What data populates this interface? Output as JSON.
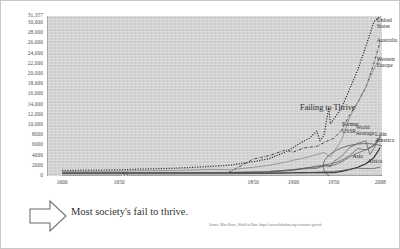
{
  "slide": {
    "caption": "Most society's fail to thrive.",
    "source": "Source: Max Roser, World in Data. https://ourworldindata.org/economic-growth",
    "arrow_icon": "right-arrow-icon"
  },
  "chart_data": {
    "type": "line",
    "title": "",
    "xlabel": "",
    "ylabel": "",
    "xlim": [
      1600,
      2008
    ],
    "ylim": [
      0,
      31357
    ],
    "grid": false,
    "legend": "inline-series-labels",
    "axis_break": {
      "after": 1650,
      "resumes": 1700
    },
    "ytick_labels": [
      "31,357",
      "30,000",
      "28,000",
      "26,000",
      "24,000",
      "22,000",
      "20,000",
      "18,000",
      "16,000",
      "14,000",
      "12,000",
      "10,000",
      "8000",
      "6000",
      "4000",
      "2000",
      "0"
    ],
    "ytick_values": [
      31357,
      30000,
      28000,
      26000,
      24000,
      22000,
      20000,
      18000,
      16000,
      14000,
      12000,
      10000,
      8000,
      6000,
      4000,
      2000,
      0
    ],
    "xtick_labels": [
      "1600",
      "1650",
      "1850",
      "1900",
      "1950",
      "2008"
    ],
    "xtick_values": [
      1600,
      1650,
      1850,
      1900,
      1950,
      2008
    ],
    "annotations": [
      {
        "text": "Failing to Thrive",
        "x": 1963,
        "y": 13500,
        "kind": "callout"
      },
      {
        "text": "ellipse-highlight",
        "cx": 1982,
        "cy": 2600,
        "rx": 28,
        "ry": 2900,
        "kind": "ellipse"
      }
    ],
    "series": [
      {
        "name": "United States",
        "style": "dotted",
        "label_x": 2001,
        "label_y": 30600,
        "x": [
          1600,
          1650,
          1700,
          1750,
          1800,
          1820,
          1850,
          1870,
          1890,
          1900,
          1910,
          1920,
          1929,
          1933,
          1938,
          1944,
          1946,
          1950,
          1960,
          1970,
          1980,
          1990,
          2000,
          2008
        ],
        "y": [
          1100,
          1200,
          1300,
          1500,
          1900,
          2100,
          2800,
          3400,
          4700,
          5600,
          6600,
          7400,
          8800,
          6900,
          8000,
          13400,
          10200,
          11100,
          13400,
          17100,
          20800,
          25400,
          30200,
          31357
        ]
      },
      {
        "name": "Australia",
        "style": "dash-dot",
        "label_x": 2001,
        "label_y": 26700,
        "x": [
          1820,
          1850,
          1870,
          1890,
          1900,
          1913,
          1929,
          1940,
          1950,
          1960,
          1970,
          1980,
          1990,
          2000,
          2008
        ],
        "y": [
          700,
          3300,
          4000,
          5100,
          4700,
          5500,
          5800,
          6700,
          7400,
          9000,
          12000,
          14400,
          17300,
          22100,
          26400
        ]
      },
      {
        "name": "Western Europe",
        "style": "solid-light",
        "label_x": 2001,
        "label_y": 23000,
        "x": [
          1600,
          1650,
          1700,
          1750,
          1800,
          1820,
          1850,
          1870,
          1890,
          1900,
          1913,
          1929,
          1938,
          1946,
          1950,
          1960,
          1970,
          1980,
          1990,
          2000,
          2008
        ],
        "y": [
          900,
          950,
          1000,
          1100,
          1300,
          1200,
          1700,
          2100,
          2700,
          3100,
          3500,
          4200,
          4600,
          3700,
          4600,
          7100,
          11500,
          14500,
          17500,
          21000,
          23300
        ]
      },
      {
        "name": "Former USSR",
        "style": "solid-thin",
        "label_x": 1958,
        "label_y": 10100,
        "x": [
          1870,
          1890,
          1913,
          1929,
          1940,
          1946,
          1950,
          1960,
          1970,
          1980,
          1990,
          1995,
          2000,
          2008
        ],
        "y": [
          900,
          1100,
          1400,
          1500,
          2100,
          1800,
          2800,
          3900,
          5600,
          6400,
          6900,
          4200,
          5400,
          7900
        ]
      },
      {
        "name": "World Average",
        "style": "solid-thin",
        "label_x": 1975,
        "label_y": 9600,
        "x": [
          1600,
          1700,
          1820,
          1870,
          1900,
          1913,
          1950,
          1960,
          1970,
          1980,
          1990,
          2000,
          2008
        ],
        "y": [
          600,
          620,
          670,
          880,
          1260,
          1520,
          2110,
          2770,
          3730,
          4520,
          5150,
          6040,
          7600
        ]
      },
      {
        "name": "Latin America",
        "style": "solid-thin",
        "label_x": 1999,
        "label_y": 8300,
        "x": [
          1820,
          1870,
          1900,
          1913,
          1950,
          1960,
          1970,
          1980,
          1990,
          2000,
          2008
        ],
        "y": [
          690,
          760,
          1110,
          1490,
          2500,
          3100,
          4000,
          5400,
          5100,
          5900,
          7700
        ]
      },
      {
        "name": "Asia",
        "style": "solid-bold",
        "label_x": 1971,
        "label_y": 3900,
        "x": [
          1600,
          1700,
          1820,
          1870,
          1900,
          1913,
          1950,
          1960,
          1970,
          1980,
          1990,
          2000,
          2008
        ],
        "y": [
          580,
          580,
          580,
          560,
          640,
          700,
          640,
          900,
          1260,
          1700,
          2400,
          3600,
          5600
        ]
      },
      {
        "name": "Africa",
        "style": "solid-thin",
        "label_x": 1990,
        "label_y": 3000,
        "x": [
          1600,
          1700,
          1820,
          1870,
          1900,
          1913,
          1950,
          1960,
          1970,
          1980,
          1990,
          2000,
          2008
        ],
        "y": [
          420,
          420,
          420,
          500,
          600,
          640,
          890,
          1060,
          1340,
          1520,
          1440,
          1450,
          1780
        ]
      }
    ]
  }
}
